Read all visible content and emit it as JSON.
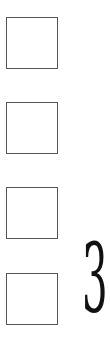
{
  "checkboxes": [
    {
      "checked": false
    },
    {
      "checked": false
    },
    {
      "checked": false
    },
    {
      "checked": false
    }
  ],
  "number_label": "3",
  "colors": {
    "box_border": "#555555",
    "digit": "#111111",
    "background": "#ffffff"
  }
}
